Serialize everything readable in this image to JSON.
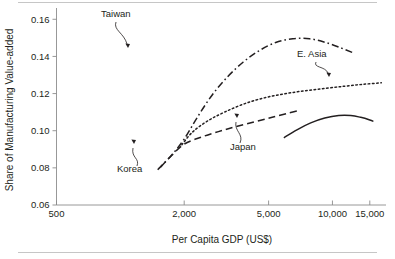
{
  "figure": {
    "background_color": "#ffffff",
    "ink_color": "#231f20",
    "axis_color": "#8c8c8c",
    "rule_color": "#bfbfbf"
  },
  "chart_data": {
    "type": "line",
    "title": "",
    "xlabel": "Per Capita GDP (US$)",
    "ylabel": "Share of Manufacturing Value-added",
    "x_scale": "log",
    "y_scale": "linear",
    "xlim": [
      500,
      17500
    ],
    "ylim": [
      0.06,
      0.165
    ],
    "xticks": [
      500,
      2000,
      5000,
      10000,
      15000
    ],
    "xtick_labels": [
      "500",
      "2,000",
      "5,000",
      "10,000",
      "15,000"
    ],
    "yticks": [
      0.06,
      0.08,
      0.1,
      0.12,
      0.14,
      0.16
    ],
    "ytick_labels": [
      "0.06",
      "0.08",
      "0.10",
      "0.12",
      "0.14",
      "0.16"
    ],
    "grid": false,
    "legend": "inline-annotations",
    "series": [
      {
        "name": "Taiwan",
        "style": "dash-dot",
        "label": "Taiwan",
        "x": [
          1500,
          1750,
          2000,
          2300,
          2700,
          3200,
          3800,
          4500,
          5400,
          6500,
          7800,
          9300,
          11000,
          12500
        ],
        "y": [
          0.079,
          0.087,
          0.0955,
          0.107,
          0.119,
          0.129,
          0.137,
          0.143,
          0.1475,
          0.1495,
          0.1495,
          0.1475,
          0.1445,
          0.142
        ]
      },
      {
        "name": "E. Asia",
        "style": "dotted",
        "label": "E. Asia",
        "x": [
          1950,
          2200,
          2600,
          3100,
          3800,
          4700,
          5900,
          7400,
          9300,
          11500,
          14000,
          17000
        ],
        "y": [
          0.0925,
          0.0995,
          0.1055,
          0.11,
          0.1143,
          0.1175,
          0.1198,
          0.1215,
          0.1228,
          0.124,
          0.125,
          0.1258
        ]
      },
      {
        "name": "Korea",
        "style": "dashed",
        "label": "Korea",
        "x": [
          1550,
          1750,
          2000,
          2400,
          2900,
          3500,
          4300,
          5200,
          6200,
          6900
        ],
        "y": [
          0.0805,
          0.0868,
          0.0928,
          0.0965,
          0.0995,
          0.1022,
          0.1048,
          0.1072,
          0.1095,
          0.1108
        ]
      },
      {
        "name": "Japan",
        "style": "solid",
        "label": "Japan",
        "x": [
          5900,
          6800,
          7900,
          9200,
          10700,
          12200,
          13600,
          15000,
          15600
        ],
        "y": [
          0.0962,
          0.1005,
          0.1042,
          0.1068,
          0.1082,
          0.1082,
          0.1072,
          0.1058,
          0.105
        ]
      }
    ],
    "annotations": [
      {
        "text": "Taiwan",
        "label_x_px": 101,
        "label_y_px": 17,
        "leader_path": "M 116 22 C 113 30, 124 33, 127 44",
        "arrow_x_px": 128,
        "arrow_y_px": 48
      },
      {
        "text": "E. Asia",
        "label_x_px": 297,
        "label_y_px": 57,
        "leader_path": "M 316 62 C 313 68, 325 66, 328 73",
        "arrow_x_px": 329,
        "arrow_y_px": 77
      },
      {
        "text": "Korea",
        "label_x_px": 117,
        "label_y_px": 172,
        "leader_path": "M 137 166 C 140 158, 131 158, 133 148",
        "arrow_x_px": 134,
        "arrow_y_px": 144
      },
      {
        "text": "Japan",
        "label_x_px": 230,
        "label_y_px": 150,
        "leader_path": "M 240 143 C 244 134, 234 131, 236 122",
        "arrow_x_px": 237,
        "arrow_y_px": 118
      }
    ]
  }
}
